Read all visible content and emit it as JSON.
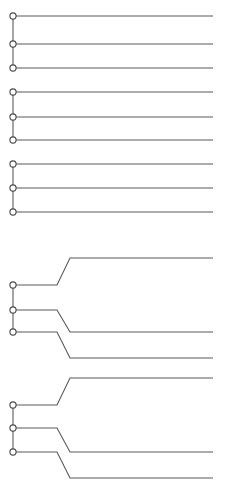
{
  "canvas": {
    "width": 229,
    "height": 493,
    "background": "#ffffff"
  },
  "style": {
    "line_color": "#5a5a5a",
    "line_width": 1.1,
    "spine_color": "#5a5a5a",
    "spine_width": 1.1,
    "node_stroke": "#4a4a4a",
    "node_fill": "#ffffff",
    "node_radius": 3.1,
    "node_stroke_width": 1.1
  },
  "geometry": {
    "node_x": 13,
    "line_start_x": 16,
    "line_end_x": 213
  },
  "chart_data": {
    "type": "line",
    "title": "",
    "xlabel": "",
    "ylabel": "",
    "grid": false,
    "legend": "none",
    "groups": [
      {
        "id": "group-1",
        "kind": "flat",
        "spine": {
          "x": 13,
          "y_top": 16,
          "y_bottom": 68
        },
        "traces": [
          {
            "id": "g1-trace-1",
            "node_y": 16,
            "points": [
              [
                16,
                16
              ],
              [
                213,
                16
              ]
            ]
          },
          {
            "id": "g1-trace-2",
            "node_y": 44,
            "points": [
              [
                16,
                44
              ],
              [
                213,
                44
              ]
            ]
          },
          {
            "id": "g1-trace-3",
            "node_y": 68,
            "points": [
              [
                16,
                68
              ],
              [
                213,
                68
              ]
            ]
          }
        ]
      },
      {
        "id": "group-2",
        "kind": "flat",
        "spine": {
          "x": 13,
          "y_top": 92,
          "y_bottom": 140
        },
        "traces": [
          {
            "id": "g2-trace-1",
            "node_y": 92,
            "points": [
              [
                16,
                92
              ],
              [
                213,
                92
              ]
            ]
          },
          {
            "id": "g2-trace-2",
            "node_y": 117,
            "points": [
              [
                16,
                117
              ],
              [
                213,
                117
              ]
            ]
          },
          {
            "id": "g2-trace-3",
            "node_y": 140,
            "points": [
              [
                16,
                140
              ],
              [
                213,
                140
              ]
            ]
          }
        ]
      },
      {
        "id": "group-3",
        "kind": "flat",
        "spine": {
          "x": 13,
          "y_top": 164,
          "y_bottom": 212
        },
        "traces": [
          {
            "id": "g3-trace-1",
            "node_y": 164,
            "points": [
              [
                16,
                164
              ],
              [
                213,
                164
              ]
            ]
          },
          {
            "id": "g3-trace-2",
            "node_y": 188,
            "points": [
              [
                16,
                188
              ],
              [
                213,
                188
              ]
            ]
          },
          {
            "id": "g3-trace-3",
            "node_y": 212,
            "points": [
              [
                16,
                212
              ],
              [
                213,
                212
              ]
            ]
          }
        ]
      },
      {
        "id": "group-4",
        "kind": "transition",
        "spine": {
          "x": 13,
          "y_top": 285,
          "y_bottom": 332
        },
        "traces": [
          {
            "id": "g4-trace-1",
            "node_y": 285,
            "points": [
              [
                16,
                285
              ],
              [
                57,
                285
              ],
              [
                70,
                258
              ],
              [
                213,
                258
              ]
            ]
          },
          {
            "id": "g4-trace-2",
            "node_y": 310,
            "points": [
              [
                16,
                310
              ],
              [
                57,
                310
              ],
              [
                70,
                332
              ],
              [
                213,
                332
              ]
            ]
          },
          {
            "id": "g4-trace-3",
            "node_y": 332,
            "points": [
              [
                16,
                332
              ],
              [
                57,
                332
              ],
              [
                70,
                358
              ],
              [
                213,
                358
              ]
            ]
          }
        ]
      },
      {
        "id": "group-5",
        "kind": "transition",
        "spine": {
          "x": 13,
          "y_top": 405,
          "y_bottom": 452
        },
        "traces": [
          {
            "id": "g5-trace-1",
            "node_y": 405,
            "points": [
              [
                16,
                405
              ],
              [
                57,
                405
              ],
              [
                70,
                378
              ],
              [
                213,
                378
              ]
            ]
          },
          {
            "id": "g5-trace-2",
            "node_y": 428,
            "points": [
              [
                16,
                428
              ],
              [
                57,
                428
              ],
              [
                70,
                452
              ],
              [
                213,
                452
              ]
            ]
          },
          {
            "id": "g5-trace-3",
            "node_y": 452,
            "points": [
              [
                16,
                452
              ],
              [
                57,
                452
              ],
              [
                70,
                478
              ],
              [
                213,
                478
              ]
            ]
          }
        ]
      }
    ]
  }
}
